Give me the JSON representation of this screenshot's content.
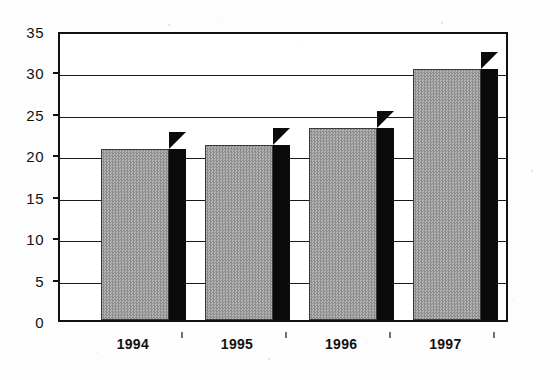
{
  "chart_data": {
    "type": "bar",
    "title": "",
    "subtitle": "",
    "xlabel": "",
    "ylabel": "",
    "categories": [
      "1994",
      "1995",
      "1996",
      "1997"
    ],
    "values": [
      20.7,
      21.1,
      23.2,
      30.3
    ],
    "series": [
      {
        "name": "",
        "values": [
          20.7,
          21.1,
          23.2,
          30.3
        ]
      }
    ],
    "ylim": [
      0,
      35
    ],
    "y_ticks": [
      0,
      5,
      10,
      15,
      20,
      25,
      30,
      35
    ],
    "y_tick_labels": [
      "0",
      "5",
      "10",
      "15",
      "20",
      "25",
      "30",
      "35"
    ],
    "grid": true,
    "grid_axis": "y",
    "legend": false,
    "legend_position": "none",
    "annotations": [],
    "style": {
      "bar_fill": "#9a9a9a",
      "bar_fill_pattern": "halftone-dither-50",
      "bar_outline": "#3a3a3a",
      "bar_side_3d": "#0b0b0b",
      "axis_color": "#111111",
      "gridline_color": "#1a1a1a",
      "background": "#ffffff",
      "three_d": true
    }
  }
}
